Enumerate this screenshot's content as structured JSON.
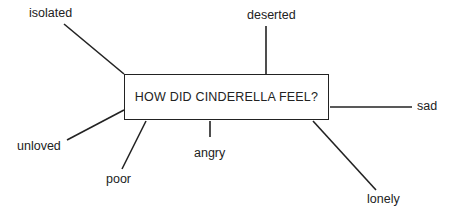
{
  "diagram": {
    "center": "HOW DID CINDERELLA FEEL?",
    "spokes": [
      {
        "id": "isolated",
        "label": "isolated"
      },
      {
        "id": "deserted",
        "label": "deserted"
      },
      {
        "id": "sad",
        "label": "sad"
      },
      {
        "id": "lonely",
        "label": "lonely"
      },
      {
        "id": "angry",
        "label": "angry"
      },
      {
        "id": "poor",
        "label": "poor"
      },
      {
        "id": "unloved",
        "label": "unloved"
      }
    ]
  }
}
